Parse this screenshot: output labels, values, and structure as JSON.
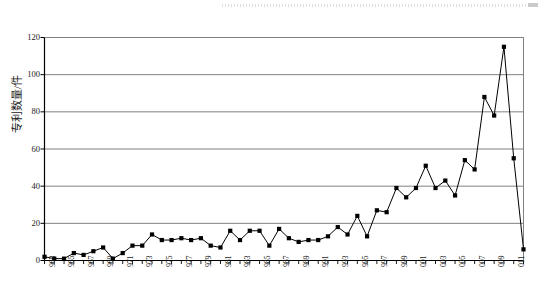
{
  "figure": {
    "title": "",
    "y_axis_label": "专利数量/件",
    "x_axis_label": "",
    "artifact": {
      "name": "scan-artifact-dotted-line",
      "visible": true
    },
    "style": {
      "line_color": "#000000",
      "marker_color": "#000000",
      "gridline_color": "#808080",
      "axis_color": "#000000",
      "background": "#ffffff"
    }
  },
  "chart_data": {
    "type": "line",
    "title": "",
    "xlabel": "",
    "ylabel": "专利数量/件",
    "ylim": [
      0,
      120
    ],
    "yticks": [
      0,
      20,
      40,
      60,
      80,
      100,
      120
    ],
    "grid": true,
    "legend": "none",
    "marker": "square",
    "xtick_labels": [
      "1963",
      "1965",
      "1967",
      "1969",
      "1971",
      "1973",
      "1975",
      "1977",
      "1979",
      "1981",
      "1983",
      "1985",
      "1987",
      "1989",
      "1991",
      "1993",
      "1995",
      "1997",
      "1999",
      "2001",
      "2003",
      "2005",
      "2007",
      "2009",
      "2011"
    ],
    "xtick_labels_rendered": [
      "963",
      "965",
      "967",
      "969",
      "971",
      "973",
      "975",
      "977",
      "979",
      "981",
      "983",
      "985",
      "987",
      "989",
      "991",
      "993",
      "995",
      "997",
      "999",
      "001",
      "003",
      "005",
      "007",
      "009",
      "011"
    ],
    "x": [
      1963,
      1964,
      1965,
      1966,
      1967,
      1968,
      1969,
      1970,
      1971,
      1972,
      1973,
      1974,
      1975,
      1976,
      1977,
      1978,
      1979,
      1980,
      1981,
      1982,
      1983,
      1984,
      1985,
      1986,
      1987,
      1988,
      1989,
      1990,
      1991,
      1992,
      1993,
      1994,
      1995,
      1996,
      1997,
      1998,
      1999,
      2000,
      2001,
      2002,
      2003,
      2004,
      2005,
      2006,
      2007,
      2008,
      2009,
      2010,
      2011,
      2012
    ],
    "values": [
      2,
      1,
      1,
      4,
      3,
      5,
      7,
      1,
      4,
      8,
      8,
      14,
      11,
      11,
      12,
      11,
      12,
      8,
      7,
      16,
      11,
      16,
      16,
      8,
      17,
      12,
      10,
      11,
      11,
      13,
      18,
      14,
      24,
      13,
      27,
      26,
      39,
      34,
      39,
      51,
      39,
      43,
      35,
      54,
      49,
      88,
      78,
      115,
      55,
      6
    ],
    "series_name": "专利数量"
  }
}
